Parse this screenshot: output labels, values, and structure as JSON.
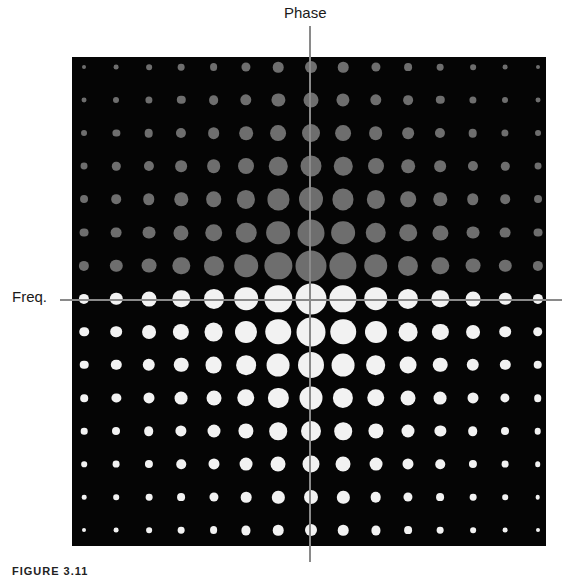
{
  "labels": {
    "vertical_axis": "Phase",
    "horizontal_axis": "Freq.",
    "caption": "FIGURE 3.11"
  },
  "colors": {
    "background_panel": "#050505",
    "upper_dots": "#6e6e6e",
    "lower_dots": "#f2f2f2",
    "axis_line": "#8a8a8a"
  },
  "grid": {
    "rows": 15,
    "cols": 15,
    "x0": 84,
    "dx": 32.4,
    "y0": 67,
    "dy": 33.1,
    "upper_rows": 7,
    "lower_rows": 8,
    "center_col_diameters": [
      12,
      15,
      18,
      21,
      24,
      27,
      31,
      31,
      29,
      26,
      23,
      20,
      17,
      14,
      12
    ],
    "col_scale": [
      0.33,
      0.4,
      0.48,
      0.56,
      0.65,
      0.76,
      0.88,
      1.0,
      0.88,
      0.76,
      0.65,
      0.56,
      0.48,
      0.4,
      0.33
    ]
  }
}
